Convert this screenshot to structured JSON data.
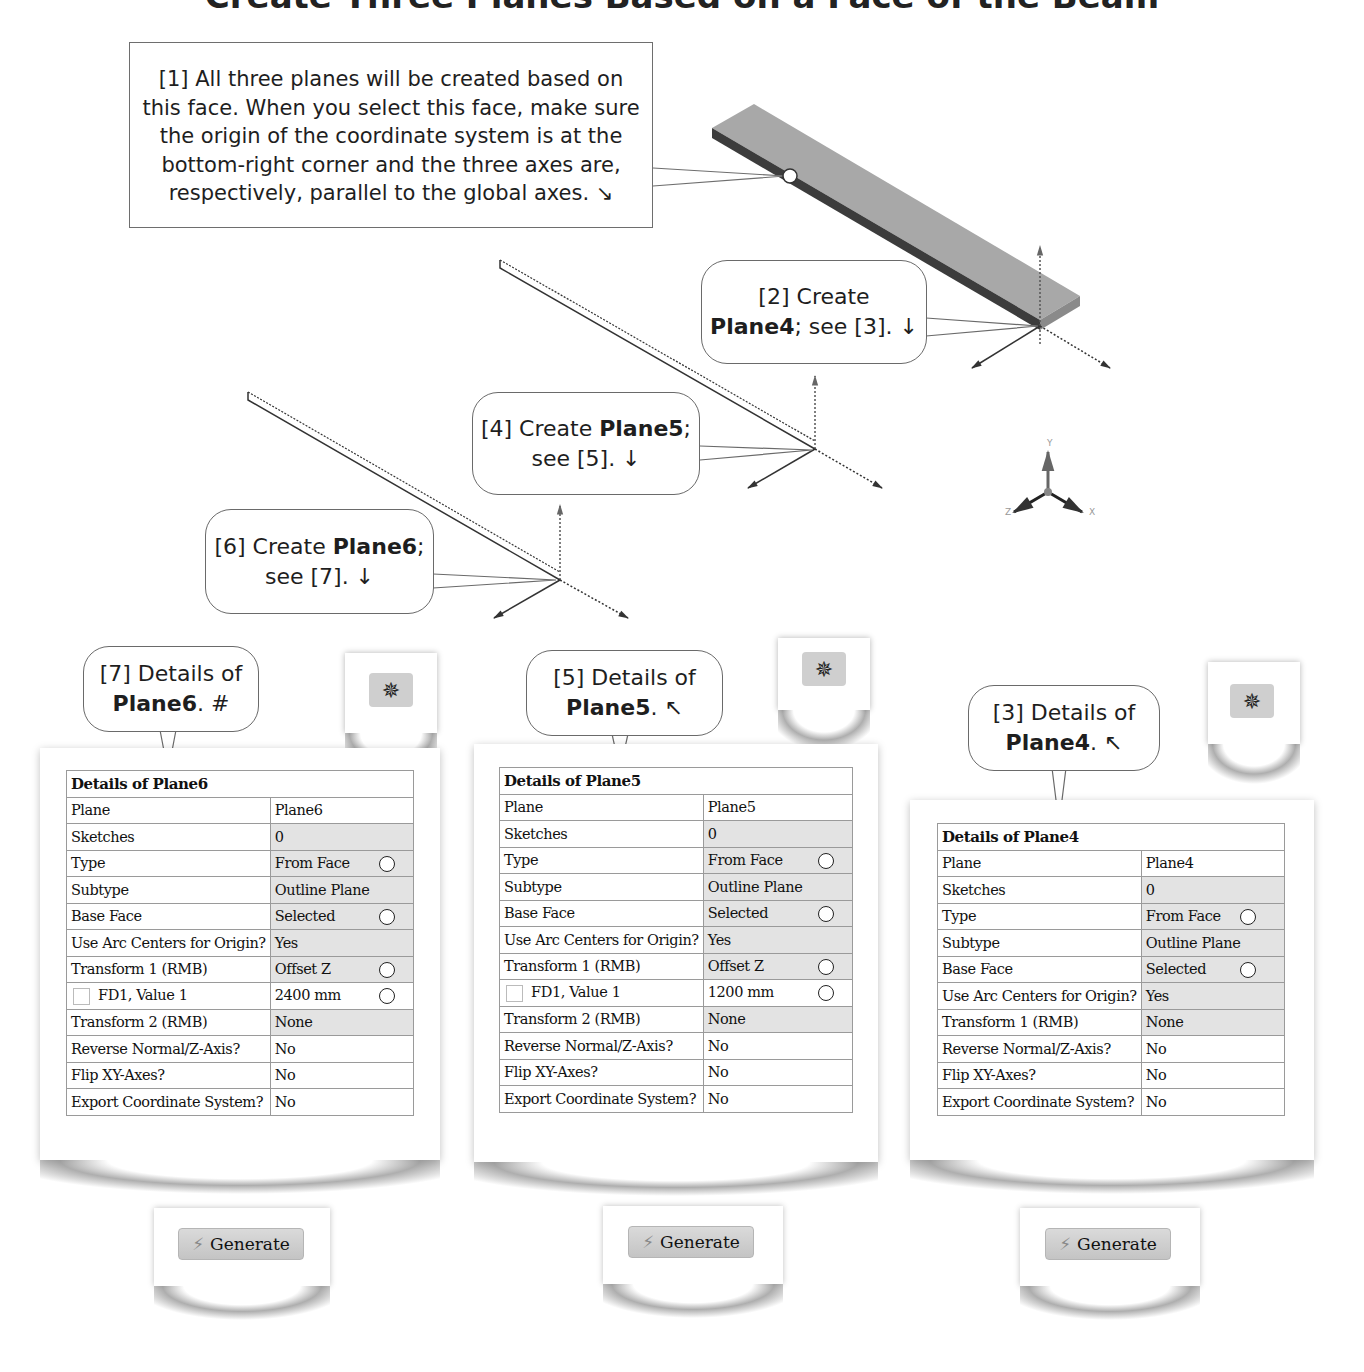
{
  "page_title": "Create Three Planes Based on a Face of the Beam",
  "note1": {
    "lines": [
      "[1] All three planes will be created based on",
      "this face. When you select this face, make sure",
      "the origin of the coordinate system is at the",
      "bottom-right corner and the three axes are,",
      "respectively, parallel to the global axes. ↘"
    ]
  },
  "callouts": {
    "c2": {
      "pre": "[2] Create",
      "bold": "Plane4",
      "post": "; see [3]. ↓"
    },
    "c4": {
      "pre": "[4] Create ",
      "bold": "Plane5",
      "post": ";",
      "line2": "see [5]. ↓"
    },
    "c6": {
      "pre": "[6] Create ",
      "bold": "Plane6",
      "post": ";",
      "line2": "see [7]. ↓"
    },
    "c7": {
      "pre": "[7] Details of",
      "bold": "Plane6",
      "post": ". #"
    },
    "c5": {
      "pre": "[5] Details of",
      "bold": "Plane5",
      "post": ". ↖"
    },
    "c3": {
      "pre": "[3] Details of",
      "bold": "Plane4",
      "post": ". ↖"
    }
  },
  "triad": {
    "x": "X",
    "y": "Y",
    "z": "Z"
  },
  "colors": {
    "beam_top": "#a8a8a8",
    "beam_side": "#3c3c3c",
    "cell_shade": "#e3e3e3",
    "grid": "#9a9a9a"
  },
  "panels": {
    "plane6": {
      "header": "Details of Plane6",
      "rows": [
        {
          "label": "Plane",
          "value": "Plane6",
          "shade": false,
          "radio": false,
          "checkbox": false
        },
        {
          "label": "Sketches",
          "value": "0",
          "shade": true,
          "radio": false,
          "checkbox": false
        },
        {
          "label": "Type",
          "value": "From Face",
          "shade": true,
          "radio": true,
          "checkbox": false
        },
        {
          "label": "Subtype",
          "value": "Outline Plane",
          "shade": true,
          "radio": false,
          "checkbox": false
        },
        {
          "label": "Base Face",
          "value": "Selected",
          "shade": true,
          "radio": true,
          "checkbox": false
        },
        {
          "label": "Use Arc Centers for Origin?",
          "value": "Yes",
          "shade": true,
          "radio": false,
          "checkbox": false
        },
        {
          "label": "Transform 1 (RMB)",
          "value": "Offset Z",
          "shade": true,
          "radio": true,
          "checkbox": false
        },
        {
          "label": "FD1, Value 1",
          "value": "2400 mm",
          "shade": false,
          "radio": true,
          "checkbox": true
        },
        {
          "label": "Transform 2 (RMB)",
          "value": "None",
          "shade": true,
          "radio": false,
          "checkbox": false
        },
        {
          "label": "Reverse Normal/Z-Axis?",
          "value": "No",
          "shade": false,
          "radio": false,
          "checkbox": false
        },
        {
          "label": "Flip XY-Axes?",
          "value": "No",
          "shade": false,
          "radio": false,
          "checkbox": false
        },
        {
          "label": "Export Coordinate System?",
          "value": "No",
          "shade": false,
          "radio": false,
          "checkbox": false
        }
      ]
    },
    "plane5": {
      "header": "Details of Plane5",
      "rows": [
        {
          "label": "Plane",
          "value": "Plane5",
          "shade": false,
          "radio": false,
          "checkbox": false
        },
        {
          "label": "Sketches",
          "value": "0",
          "shade": true,
          "radio": false,
          "checkbox": false
        },
        {
          "label": "Type",
          "value": "From Face",
          "shade": true,
          "radio": true,
          "checkbox": false
        },
        {
          "label": "Subtype",
          "value": "Outline Plane",
          "shade": true,
          "radio": false,
          "checkbox": false
        },
        {
          "label": "Base Face",
          "value": "Selected",
          "shade": true,
          "radio": true,
          "checkbox": false
        },
        {
          "label": "Use Arc Centers for Origin?",
          "value": "Yes",
          "shade": true,
          "radio": false,
          "checkbox": false
        },
        {
          "label": "Transform 1 (RMB)",
          "value": "Offset Z",
          "shade": true,
          "radio": true,
          "checkbox": false
        },
        {
          "label": "FD1, Value 1",
          "value": "1200 mm",
          "shade": false,
          "radio": true,
          "checkbox": true
        },
        {
          "label": "Transform 2 (RMB)",
          "value": "None",
          "shade": true,
          "radio": false,
          "checkbox": false
        },
        {
          "label": "Reverse Normal/Z-Axis?",
          "value": "No",
          "shade": false,
          "radio": false,
          "checkbox": false
        },
        {
          "label": "Flip XY-Axes?",
          "value": "No",
          "shade": false,
          "radio": false,
          "checkbox": false
        },
        {
          "label": "Export Coordinate System?",
          "value": "No",
          "shade": false,
          "radio": false,
          "checkbox": false
        }
      ]
    },
    "plane4": {
      "header": "Details of Plane4",
      "rows": [
        {
          "label": "Plane",
          "value": "Plane4",
          "shade": false,
          "radio": false,
          "checkbox": false
        },
        {
          "label": "Sketches",
          "value": "0",
          "shade": true,
          "radio": false,
          "checkbox": false
        },
        {
          "label": "Type",
          "value": "From Face",
          "shade": true,
          "radio": true,
          "checkbox": false
        },
        {
          "label": "Subtype",
          "value": "Outline Plane",
          "shade": true,
          "radio": false,
          "checkbox": false
        },
        {
          "label": "Base Face",
          "value": "Selected",
          "shade": true,
          "radio": true,
          "checkbox": false
        },
        {
          "label": "Use Arc Centers for Origin?",
          "value": "Yes",
          "shade": true,
          "radio": false,
          "checkbox": false
        },
        {
          "label": "Transform 1 (RMB)",
          "value": "None",
          "shade": true,
          "radio": false,
          "checkbox": false
        },
        {
          "label": "Reverse Normal/Z-Axis?",
          "value": "No",
          "shade": false,
          "radio": false,
          "checkbox": false
        },
        {
          "label": "Flip XY-Axes?",
          "value": "No",
          "shade": false,
          "radio": false,
          "checkbox": false
        },
        {
          "label": "Export Coordinate System?",
          "value": "No",
          "shade": false,
          "radio": false,
          "checkbox": false
        }
      ]
    }
  },
  "toolbar": {
    "new_plane_icon": "new-plane-icon",
    "generate_label": "Generate",
    "generate_icon": "lightning-bolt-icon"
  }
}
